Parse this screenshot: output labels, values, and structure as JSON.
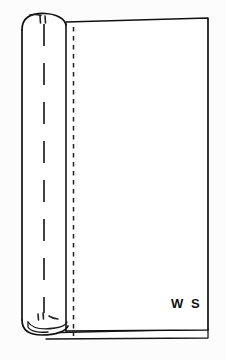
{
  "canvas": {
    "width": 226,
    "height": 360,
    "background_color": "#fcfcfc",
    "fabric_fill_color": "#ffffff",
    "line_color": "#111111"
  },
  "diagram": {
    "name": "fabric-fold-with-stitch-line",
    "labels": [
      {
        "id": "wrong-side",
        "text": "W S",
        "meaning": "wrong side of fabric",
        "x": 171,
        "y": 298
      }
    ]
  },
  "geometry": {
    "main_panel": {
      "top_left_x": 66,
      "top_left_y": 22,
      "top_right_x": 208,
      "top_right_y": 18,
      "bottom_right_y": 330,
      "bottom_left_y": 331
    },
    "fold_roll": {
      "outer_edge_x": 22,
      "crease_x": 66,
      "top_y": 14,
      "bottom_y": 332
    },
    "center_dash_line": {
      "x": 44,
      "top_y": 24,
      "bottom_y": 314,
      "dash": "22 17"
    },
    "stitch_dash_line": {
      "x": 73,
      "top_y": 26,
      "bottom_y": 336,
      "dash": "4.5 4.5"
    },
    "underlap_sliver": {
      "left_x": 36,
      "right_x": 208,
      "top_y": 331,
      "bottom_y": 339
    }
  },
  "markings": {
    "tick_marks": [
      {
        "id": "top-tick-pair",
        "x": 41,
        "y": 17,
        "count": 2
      },
      {
        "id": "bottom-tick-pair",
        "x": 41,
        "y": 315,
        "count": 2
      }
    ]
  }
}
